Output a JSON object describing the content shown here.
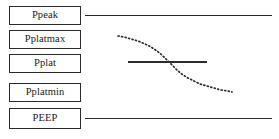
{
  "figure": {
    "background_color": "#ffffff",
    "line_color": "#2b2b2b",
    "text_color": "#1a1a1a",
    "width": 279,
    "height": 139
  },
  "labels": [
    {
      "id": "ppeak",
      "text": "Ppeak",
      "x": 9,
      "y": 6,
      "w": 72,
      "h": 19
    },
    {
      "id": "pplatmax",
      "text": "Pplatmax",
      "x": 9,
      "y": 30,
      "w": 72,
      "h": 19
    },
    {
      "id": "pplat",
      "text": "Pplat",
      "x": 9,
      "y": 54,
      "w": 72,
      "h": 19
    },
    {
      "id": "pplatmin",
      "text": "Pplatmin",
      "x": 9,
      "y": 83,
      "w": 72,
      "h": 19
    },
    {
      "id": "peep",
      "text": "PEEP",
      "x": 9,
      "y": 108,
      "w": 72,
      "h": 21
    }
  ],
  "chart_data": {
    "type": "line",
    "title": "",
    "xlabel": "",
    "ylabel": "",
    "xlim": [
      0,
      279
    ],
    "ylim": [
      139,
      0
    ],
    "grid": false,
    "legend": "none",
    "series": [
      {
        "name": "Ppeak reference line",
        "style": "solid",
        "level_label": "Ppeak",
        "x": [
          85,
          272
        ],
        "y": [
          15,
          15
        ]
      },
      {
        "name": "Pplat reference line",
        "style": "solid",
        "level_label": "Pplat",
        "x": [
          128,
          207
        ],
        "y": [
          62,
          62
        ]
      },
      {
        "name": "PEEP reference line",
        "style": "solid",
        "level_label": "PEEP",
        "x": [
          85,
          272
        ],
        "y": [
          118,
          118
        ]
      },
      {
        "name": "Pressure decay sigmoid",
        "style": "dotted",
        "x": [
          118,
          124,
          131,
          138,
          145,
          151,
          157,
          162,
          166,
          170,
          174,
          178,
          183,
          188,
          194,
          200,
          207,
          214,
          221,
          228,
          232
        ],
        "y": [
          36,
          37,
          39,
          41,
          44,
          47,
          51,
          55,
          59,
          63,
          67,
          71,
          75,
          78,
          81,
          84,
          86,
          88,
          90,
          91,
          92
        ]
      }
    ]
  },
  "caption": {
    "text": ""
  }
}
